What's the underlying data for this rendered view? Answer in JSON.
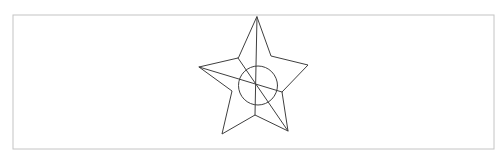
{
  "canvas": {
    "width": 497,
    "height": 155,
    "background_color": "#ffffff",
    "border_color": "#c4c4c4",
    "border_width": 1,
    "border_rect": {
      "x": 13,
      "y": 15,
      "width": 481,
      "height": 134
    }
  },
  "drawing": {
    "description": "line sketch of five-pointed star with center circle and construction lines",
    "stroke_color": "#3f3f3f",
    "stroke_width": 1,
    "fill": "none",
    "star_outline_points": [
      [
        257,
        17
      ],
      [
        271,
        56
      ],
      [
        308,
        65
      ],
      [
        282,
        92
      ],
      [
        288,
        131
      ],
      [
        255,
        115
      ],
      [
        222,
        134
      ],
      [
        232,
        91
      ],
      [
        199,
        67
      ],
      [
        238,
        58
      ]
    ],
    "lines": [
      {
        "name": "vertical-axis-line",
        "x1": 257,
        "y1": 17,
        "x2": 255,
        "y2": 115
      },
      {
        "name": "diagonal-left-point-line",
        "x1": 199,
        "y1": 67,
        "x2": 282,
        "y2": 92
      },
      {
        "name": "diagonal-to-bottom-right-line",
        "x1": 238,
        "y1": 58,
        "x2": 288,
        "y2": 131
      }
    ],
    "circle": {
      "cx": 258,
      "cy": 85.5,
      "r": 19.5
    }
  }
}
